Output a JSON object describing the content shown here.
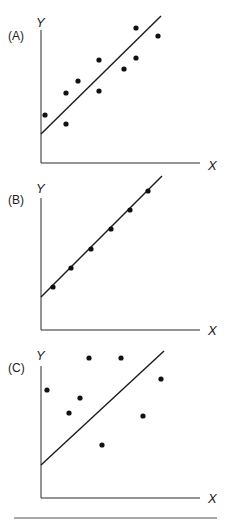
{
  "chart_data": [
    {
      "type": "scatter",
      "panel_label": "(A)",
      "xlabel": "X",
      "ylabel": "Y",
      "description": "Positive correlation with scatter around fitted line",
      "axes_px": {
        "x0": 41,
        "y0": 163,
        "ytop": 30,
        "xend": 200
      },
      "points_px": [
        [
          45,
          115
        ],
        [
          66,
          124
        ],
        [
          66,
          93
        ],
        [
          78,
          81
        ],
        [
          99,
          91
        ],
        [
          99,
          60
        ],
        [
          124,
          69
        ],
        [
          136,
          58
        ],
        [
          136,
          28
        ],
        [
          158,
          36
        ]
      ],
      "fit_line_px": [
        [
          41,
          134
        ],
        [
          161,
          16
        ]
      ],
      "grid": false,
      "label_pos": {
        "panel": [
          8,
          40
        ],
        "y": [
          36,
          27
        ],
        "x": [
          208,
          170
        ]
      }
    },
    {
      "type": "scatter",
      "panel_label": "(B)",
      "xlabel": "X",
      "ylabel": "Y",
      "description": "Perfect positive correlation, all points on line",
      "axes_px": {
        "x0": 41,
        "y0": 330,
        "ytop": 198,
        "xend": 200
      },
      "points_px": [
        [
          53,
          287
        ],
        [
          71,
          268
        ],
        [
          91,
          249
        ],
        [
          111,
          229
        ],
        [
          130,
          210
        ],
        [
          148,
          191
        ]
      ],
      "fit_line_px": [
        [
          41,
          297
        ],
        [
          162,
          176
        ]
      ],
      "grid": false,
      "label_pos": {
        "panel": [
          8,
          204
        ],
        "y": [
          36,
          193
        ],
        "x": [
          208,
          335
        ]
      }
    },
    {
      "type": "scatter",
      "panel_label": "(C)",
      "xlabel": "X",
      "ylabel": "Y",
      "description": "No correlation, points scattered randomly around line",
      "axes_px": {
        "x0": 41,
        "y0": 498,
        "ytop": 366,
        "xend": 200
      },
      "points_px": [
        [
          47,
          390
        ],
        [
          69,
          413
        ],
        [
          80,
          398
        ],
        [
          89,
          358
        ],
        [
          102,
          445
        ],
        [
          121,
          358
        ],
        [
          143,
          416
        ],
        [
          161,
          379
        ]
      ],
      "fit_line_px": [
        [
          41,
          465
        ],
        [
          164,
          351
        ]
      ],
      "grid": false,
      "label_pos": {
        "panel": [
          8,
          372
        ],
        "y": [
          36,
          360
        ],
        "x": [
          208,
          503
        ]
      }
    }
  ],
  "footer_rule": {
    "x1": 14,
    "x2": 217,
    "y": 518
  }
}
